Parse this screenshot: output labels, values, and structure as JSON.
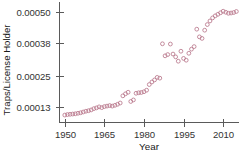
{
  "chart_data": {
    "type": "scatter",
    "title": "",
    "xlabel": "Year",
    "ylabel": "Traps/License Holder",
    "xlim": [
      1948,
      2016
    ],
    "ylim": [
      7e-05,
      0.00054
    ],
    "grid": false,
    "legend": null,
    "marker_style": "open-circle",
    "marker_color": "#b9798c",
    "xticks": [
      1950,
      1965,
      1980,
      1995,
      2010
    ],
    "xtick_labels": [
      "1950",
      "1965",
      "1980",
      "1995",
      "2010"
    ],
    "yticks": [
      0.00013,
      0.00025,
      0.00038,
      0.0005
    ],
    "ytick_labels": [
      "0.00013",
      "0.00025",
      "0.00038",
      "0.00050"
    ],
    "x": [
      1950,
      1951,
      1952,
      1953,
      1954,
      1955,
      1956,
      1957,
      1958,
      1959,
      1960,
      1961,
      1962,
      1963,
      1964,
      1965,
      1966,
      1967,
      1968,
      1969,
      1970,
      1971,
      1972,
      1973,
      1974,
      1975,
      1976,
      1977,
      1978,
      1979,
      1980,
      1981,
      1982,
      1983,
      1984,
      1985,
      1986,
      1987,
      1988,
      1989,
      1990,
      1991,
      1992,
      1993,
      1994,
      1995,
      1996,
      1997,
      1998,
      1999,
      2000,
      2001,
      2002,
      2003,
      2004,
      2005,
      2006,
      2007,
      2008,
      2009,
      2010,
      2011,
      2012,
      2013,
      2014,
      2015
    ],
    "y": [
      9.9e-05,
      0.000101,
      0.000102,
      0.000103,
      0.000104,
      0.000106,
      0.000108,
      0.000111,
      0.000114,
      0.000116,
      0.000119,
      0.000124,
      0.000127,
      0.000131,
      0.000128,
      0.000132,
      0.000134,
      0.000136,
      0.000134,
      0.000137,
      0.000141,
      0.000146,
      0.000174,
      0.000182,
      0.000188,
      0.000152,
      0.000158,
      0.000184,
      0.000186,
      0.000187,
      0.00019,
      0.000196,
      0.000218,
      0.000228,
      0.000236,
      0.000246,
      0.000243,
      0.000377,
      0.00033,
      0.000335,
      0.000376,
      0.000337,
      0.000326,
      0.000309,
      0.000348,
      0.00032,
      0.000313,
      0.00034,
      0.000356,
      0.000366,
      0.000434,
      0.000404,
      0.000398,
      0.00043,
      0.000452,
      0.000466,
      0.000478,
      0.000486,
      0.000492,
      0.000498,
      0.000504,
      0.0005,
      0.000496,
      0.000497,
      0.000499,
      0.000503
    ]
  },
  "axes": {
    "xlabel": "Year",
    "ylabel": "Traps/License Holder"
  },
  "top_fragment": {
    "text": ""
  }
}
